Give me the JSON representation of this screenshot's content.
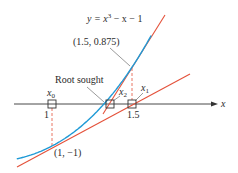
{
  "diagram": {
    "equation": {
      "prefix": "y = x",
      "exponent": "3",
      "suffix": " − x − 1"
    },
    "function": "x^3 - x - 1",
    "axis_label": "x",
    "root_label": "Root sought",
    "points": [
      {
        "name": "initial-point",
        "label": "(1, −1)",
        "x": 1,
        "y": -1
      },
      {
        "name": "second-point",
        "label": "(1.5, 0.875)",
        "x": 1.5,
        "y": 0.875
      }
    ],
    "iterates": [
      {
        "label": "x",
        "sub": "0",
        "value": 1,
        "tick": "1"
      },
      {
        "label": "x",
        "sub": "1",
        "value": 1.5,
        "tick": "1.5"
      },
      {
        "label": "x",
        "sub": "2",
        "value": 1.3478,
        "tick": ""
      }
    ],
    "colors": {
      "curve": "#1f9ad6",
      "tangent": "#e4513a",
      "axis": "#333333",
      "guide": "#e4513a",
      "text": "#2b2b2b"
    }
  }
}
